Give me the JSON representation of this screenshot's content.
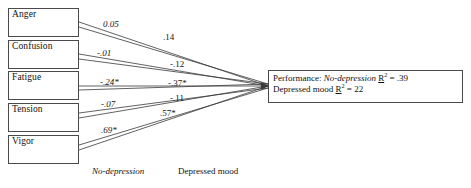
{
  "diagram": {
    "type": "path-diagram",
    "title": "",
    "predictors": [
      {
        "label": "Anger"
      },
      {
        "label": "Confusion"
      },
      {
        "label": "Fatigue"
      },
      {
        "label": "Tension"
      },
      {
        "label": "Vigor"
      }
    ],
    "outcome": {
      "prefix": "Performance:",
      "line1_group": "No-depression",
      "line1_stat_r": "R",
      "line1_stat_exp": "2",
      "line1_stat_eq": "= .39",
      "line2_group": "Depressed mood",
      "line2_stat_r": "R",
      "line2_stat_exp": "2",
      "line2_stat_eq": "= 22"
    },
    "paths_no_depression": [
      {
        "from": "Anger",
        "value": "0.05"
      },
      {
        "from": "Confusion",
        "value": "-.01"
      },
      {
        "from": "Fatigue",
        "value": "-.24*"
      },
      {
        "from": "Tension",
        "value": "-.07"
      },
      {
        "from": "Vigor",
        "value": ".69*"
      }
    ],
    "paths_depressed_mood": [
      {
        "from": "Anger",
        "value": ".14"
      },
      {
        "from": "Confusion",
        "value": "-.12"
      },
      {
        "from": "Fatigue",
        "value": "-.37*"
      },
      {
        "from": "Tension",
        "value": "-.11"
      },
      {
        "from": "Vigor",
        "value": ".57*"
      }
    ],
    "legend": {
      "no_depression": "No-depression",
      "depressed_mood": "Depressed mood"
    },
    "colors": {
      "line": "#3a3a3a",
      "box_border": "#4a4a4a",
      "text": "#101010",
      "background": "#ffffff"
    }
  }
}
